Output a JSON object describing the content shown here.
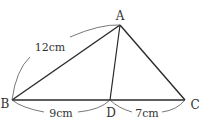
{
  "figure": {
    "type": "triangle-with-cevian",
    "stroke_color": "#2a2a2a",
    "arc_color": "#555555",
    "vertices": {
      "A": {
        "label": "A",
        "x": 120,
        "y": 25
      },
      "B": {
        "label": "B",
        "x": 12,
        "y": 100
      },
      "C": {
        "label": "C",
        "x": 185,
        "y": 100
      },
      "D": {
        "label": "D",
        "x": 110,
        "y": 100
      }
    },
    "segments": [
      {
        "from": "A",
        "to": "B"
      },
      {
        "from": "A",
        "to": "C"
      },
      {
        "from": "B",
        "to": "C"
      },
      {
        "from": "A",
        "to": "D"
      }
    ],
    "measurements": {
      "AB": {
        "label": "12cm",
        "value": 12,
        "unit": "cm"
      },
      "BD": {
        "label": "9cm",
        "value": 9,
        "unit": "cm"
      },
      "DC": {
        "label": "7cm",
        "value": 7,
        "unit": "cm"
      }
    }
  }
}
